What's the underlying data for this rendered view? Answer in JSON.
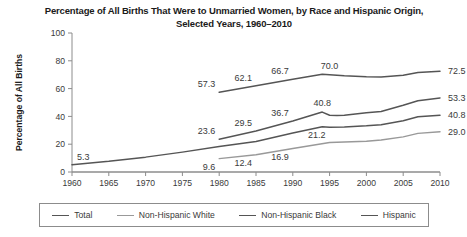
{
  "chart_data": {
    "type": "line",
    "title": "Percentage of All Births That Were to Unmarried Women, by Race and Hispanic Origin, Selected Years, 1960–2010",
    "title_line1": "Percentage of All Births That Were to Unmarried Women, by Race and Hispanic",
    "title_line2": "Origin, Selected Years, 1960–2010",
    "xlabel": "",
    "ylabel": "Percentage of All Births",
    "xlim": [
      1960,
      2010
    ],
    "ylim": [
      0,
      100
    ],
    "yticks": [
      0,
      20,
      40,
      60,
      80,
      100
    ],
    "xticks": [
      1960,
      1965,
      1970,
      1975,
      1980,
      1985,
      1990,
      1995,
      2000,
      2005,
      2010
    ],
    "grid": false,
    "legend_position": "bottom",
    "series": [
      {
        "name": "Total",
        "color": "#555555",
        "width": 1.5,
        "x": [
          1960,
          1965,
          1970,
          1975,
          1980,
          1985,
          1990,
          1994,
          1995,
          1997,
          2000,
          2002,
          2005,
          2007,
          2010
        ],
        "y": [
          5.3,
          7.7,
          10.7,
          14.3,
          18.4,
          22.0,
          28.0,
          32.6,
          32.2,
          32.4,
          33.2,
          34.0,
          36.9,
          39.7,
          40.8
        ],
        "labels": [
          {
            "x": 2010,
            "y": 40.8,
            "text": "40.8",
            "position": "right"
          }
        ]
      },
      {
        "name": "Non-Hispanic White",
        "color": "#999999",
        "width": 1.4,
        "x": [
          1980,
          1985,
          1990,
          1995,
          2000,
          2002,
          2005,
          2007,
          2010
        ],
        "y": [
          9.6,
          12.4,
          16.9,
          21.2,
          22.1,
          23.0,
          25.3,
          27.8,
          29.0
        ],
        "labels": [
          {
            "x": 1980,
            "y": 9.6,
            "text": "9.6",
            "position": "below-left"
          },
          {
            "x": 1985,
            "y": 12.4,
            "text": "12.4",
            "position": "below-left"
          },
          {
            "x": 1990,
            "y": 16.9,
            "text": "16.9",
            "position": "below-left"
          },
          {
            "x": 1995,
            "y": 21.2,
            "text": "21.2",
            "position": "above-left"
          },
          {
            "x": 2010,
            "y": 29.0,
            "text": "29.0",
            "position": "right"
          }
        ]
      },
      {
        "name": "Non-Hispanic Black",
        "color": "#555555",
        "width": 1.5,
        "x": [
          1980,
          1985,
          1990,
          1994,
          1995,
          1997,
          2000,
          2002,
          2005,
          2007,
          2010
        ],
        "y": [
          57.3,
          62.1,
          66.7,
          70.4,
          70.0,
          69.2,
          68.5,
          68.3,
          69.6,
          71.6,
          72.5
        ],
        "labels": [
          {
            "x": 1980,
            "y": 57.3,
            "text": "57.3",
            "position": "above-left"
          },
          {
            "x": 1985,
            "y": 62.1,
            "text": "62.1",
            "position": "above-left"
          },
          {
            "x": 1990,
            "y": 66.7,
            "text": "66.7",
            "position": "above-left"
          },
          {
            "x": 1995,
            "y": 70.0,
            "text": "70.0",
            "position": "above"
          },
          {
            "x": 2010,
            "y": 72.5,
            "text": "72.5",
            "position": "right"
          }
        ]
      },
      {
        "name": "Hispanic",
        "color": "#555555",
        "width": 1.5,
        "x": [
          1980,
          1985,
          1990,
          1994,
          1995,
          1996,
          1997,
          2000,
          2002,
          2005,
          2007,
          2010
        ],
        "y": [
          23.6,
          29.5,
          36.7,
          43.1,
          40.8,
          40.7,
          40.9,
          42.7,
          43.5,
          48.0,
          51.3,
          53.3
        ],
        "labels": [
          {
            "x": 1980,
            "y": 23.6,
            "text": "23.6",
            "position": "above-left"
          },
          {
            "x": 1985,
            "y": 29.5,
            "text": "29.5",
            "position": "above-left"
          },
          {
            "x": 1990,
            "y": 36.7,
            "text": "36.7",
            "position": "above-left"
          },
          {
            "x": 1994,
            "y": 43.1,
            "text": "40.8",
            "position": "above"
          },
          {
            "x": 2010,
            "y": 53.3,
            "text": "53.3",
            "position": "right"
          }
        ]
      }
    ],
    "origin_label": {
      "x": 1960,
      "y": 5.3,
      "text": "5.3"
    },
    "legend": [
      {
        "label": "Total",
        "color": "#555555"
      },
      {
        "label": "Non-Hispanic White",
        "color": "#999999"
      },
      {
        "label": "Non-Hispanic Black",
        "color": "#555555"
      },
      {
        "label": "Hispanic",
        "color": "#555555"
      }
    ]
  }
}
